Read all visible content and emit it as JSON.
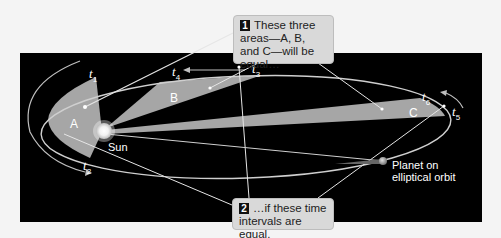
{
  "callouts": [
    {
      "number": "1",
      "text": "These three areas—A, B, and C—will be equal…"
    },
    {
      "number": "2",
      "text": "…if these time intervals are equal."
    }
  ],
  "sectors": {
    "a": "A",
    "b": "B",
    "c": "C"
  },
  "labels": {
    "sun": "Sun",
    "planet": "Planet on elliptical orbit"
  },
  "times": [
    {
      "t": "t",
      "sub": "1"
    },
    {
      "t": "t",
      "sub": "2"
    },
    {
      "t": "t",
      "sub": "3"
    },
    {
      "t": "t",
      "sub": "4"
    },
    {
      "t": "t",
      "sub": "5"
    },
    {
      "t": "t",
      "sub": "6"
    }
  ],
  "colors": {
    "background": "#000000",
    "sector": "#a6a6a6",
    "orbit": "#cfcfcf",
    "callout_bg": "#d9d9d9"
  }
}
